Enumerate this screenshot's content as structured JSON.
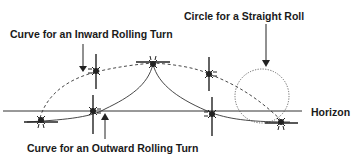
{
  "diagram": {
    "labels": {
      "inward": "Curve for an Inward Rolling Turn",
      "straight": "Circle for a Straight Roll",
      "outward": "Curve for an Outward Rolling Turn",
      "horizon": "Horizon"
    },
    "colors": {
      "line": "#222222",
      "background": "#ffffff"
    },
    "elements": {
      "horizon_line": {
        "x1": 3,
        "x2": 302,
        "y": 111
      },
      "dashed_inward_curve": "large dashed ellipse from left plane over top plane to right plane",
      "outward_curves": "two solid cusp curves meeting at top center plane",
      "straight_roll_circle": {
        "cx": 262,
        "cy": 96,
        "r": 27,
        "style": "dotted"
      },
      "aircraft_count": 7
    }
  }
}
